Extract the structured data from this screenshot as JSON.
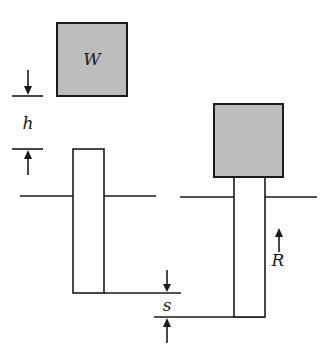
{
  "diagram": {
    "title": "",
    "labels": {
      "weight": "W",
      "drop_height": "h",
      "set": "s",
      "resistance": "R"
    },
    "colors": {
      "block_fill": "#bdbdbd",
      "line": "#1a1a1a",
      "background": "#ffffff"
    },
    "panels": [
      {
        "name": "before-impact",
        "description": "Weight W held at height h above pile top"
      },
      {
        "name": "after-impact",
        "description": "Weight resting on pile driven down by set s, resisted by R"
      }
    ]
  }
}
